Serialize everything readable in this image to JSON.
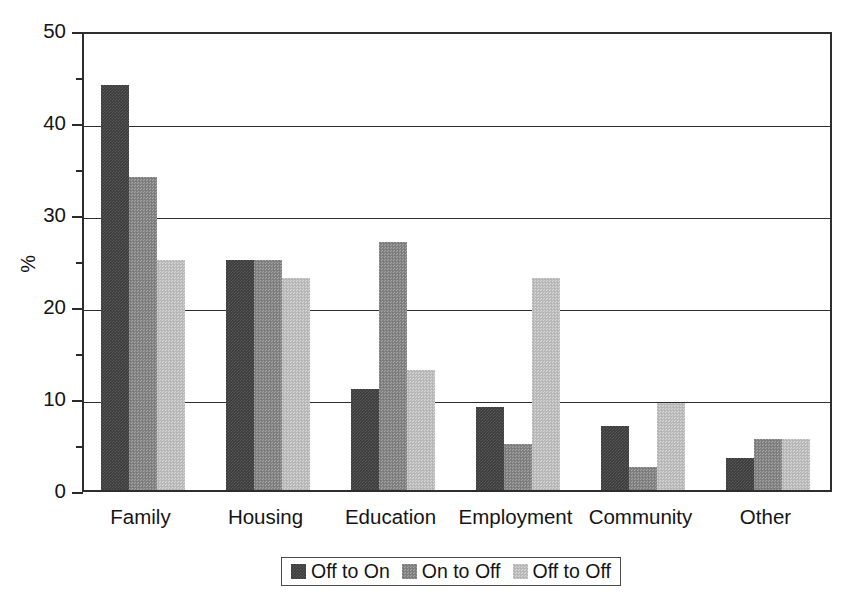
{
  "chart_data": {
    "type": "bar",
    "title": "",
    "subtitle": "",
    "xlabel": "",
    "ylabel": "%",
    "ylim": [
      0,
      50
    ],
    "y_ticks_major": [
      0,
      10,
      20,
      30,
      40,
      50
    ],
    "y_ticks_minor": [
      5,
      15,
      25,
      35,
      45
    ],
    "y_tick_labels": [
      "0",
      "10",
      "20",
      "30",
      "40",
      "50"
    ],
    "grid": "horizontal-major",
    "legend_position": "bottom-center",
    "categories": [
      "Family",
      "Housing",
      "Education",
      "Employment",
      "Community",
      "Other"
    ],
    "series": [
      {
        "name": "Off to On",
        "color": "#3b3b3b",
        "values": [
          44,
          25,
          11,
          9,
          7,
          3.5
        ]
      },
      {
        "name": "On to Off",
        "color": "#848484",
        "values": [
          34,
          25,
          27,
          5,
          2.5,
          5.5
        ]
      },
      {
        "name": "Off to Off",
        "color": "#bdbdbd",
        "values": [
          25,
          23,
          13,
          23,
          9.5,
          5.5
        ]
      }
    ]
  },
  "legend": {
    "entries": [
      {
        "label": "Off to On"
      },
      {
        "label": "On to Off"
      },
      {
        "label": "Off to Off"
      }
    ]
  }
}
